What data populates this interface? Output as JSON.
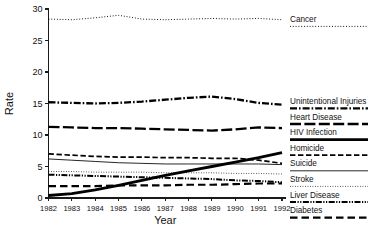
{
  "chart_data": {
    "type": "line",
    "title": "",
    "xlabel": "Year",
    "ylabel": "Rate",
    "x": [
      1982,
      1983,
      1984,
      1985,
      1986,
      1987,
      1988,
      1989,
      1990,
      1991,
      1992
    ],
    "xtick_labels": [
      "1982",
      "1983",
      "1984",
      "1985",
      "1986",
      "1987",
      "1988",
      "1989",
      "1990",
      "1991",
      "1992"
    ],
    "ytick_labels": [
      "0",
      "5",
      "10",
      "15",
      "20",
      "25",
      "30"
    ],
    "yticks": [
      0,
      5,
      10,
      15,
      20,
      25,
      30
    ],
    "ylim": [
      0,
      30
    ],
    "xlim": [
      1982,
      1992
    ],
    "grid": false,
    "legend_position": "right",
    "series": [
      {
        "name": "Cancer",
        "style": "dotted",
        "values": [
          28.4,
          28.3,
          28.6,
          29.0,
          28.4,
          28.3,
          28.4,
          28.5,
          28.4,
          28.5,
          28.3
        ]
      },
      {
        "name": "Unintentional Injuries",
        "style": "dash-dot",
        "values": [
          15.2,
          15.1,
          15.0,
          15.1,
          15.3,
          15.6,
          15.9,
          16.1,
          15.7,
          15.1,
          14.8
        ]
      },
      {
        "name": "Heart Disease",
        "style": "long-dash",
        "values": [
          11.3,
          11.2,
          11.1,
          11.1,
          11.0,
          10.9,
          10.8,
          10.7,
          10.9,
          11.2,
          11.1
        ]
      },
      {
        "name": "HIV Infection",
        "style": "thick-solid",
        "values": [
          0.4,
          0.7,
          1.3,
          2.0,
          2.8,
          3.6,
          4.3,
          5.0,
          5.7,
          6.4,
          7.2
        ]
      },
      {
        "name": "Homicide",
        "style": "dashed",
        "values": [
          7.0,
          6.8,
          6.6,
          6.5,
          6.5,
          6.4,
          6.4,
          6.3,
          6.3,
          6.0,
          5.5
        ]
      },
      {
        "name": "Suicide",
        "style": "thin-solid",
        "values": [
          6.2,
          6.0,
          5.8,
          5.6,
          5.5,
          5.4,
          5.4,
          5.4,
          5.4,
          5.4,
          5.3
        ]
      },
      {
        "name": "Stroke",
        "style": "fine-dotted",
        "values": [
          4.2,
          4.2,
          4.1,
          4.1,
          4.1,
          4.0,
          4.0,
          4.0,
          3.9,
          3.9,
          3.8
        ]
      },
      {
        "name": "Liver Disease",
        "style": "dash-dot-dot",
        "values": [
          3.7,
          3.6,
          3.5,
          3.4,
          3.3,
          3.2,
          3.1,
          3.0,
          2.8,
          2.7,
          2.5
        ]
      },
      {
        "name": "Diabetes",
        "style": "dashed-wide",
        "values": [
          1.9,
          1.9,
          1.9,
          2.0,
          2.0,
          2.0,
          2.1,
          2.1,
          2.2,
          2.3,
          2.3
        ]
      }
    ]
  },
  "legend": {
    "items": [
      {
        "label": "Cancer"
      },
      {
        "label": "Unintentional Injuries"
      },
      {
        "label": "Heart Disease"
      },
      {
        "label": "HIV Infection"
      },
      {
        "label": "Homicide"
      },
      {
        "label": "Suicide"
      },
      {
        "label": "Stroke"
      },
      {
        "label": "Liver Disease"
      },
      {
        "label": "Diabetes"
      }
    ]
  },
  "axes": {
    "y_title": "Rate",
    "x_title": "Year"
  }
}
